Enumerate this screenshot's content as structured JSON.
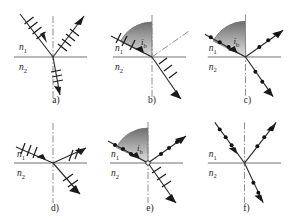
{
  "figure": {
    "medium_labels": {
      "upper": "n",
      "upper_sub": "1",
      "lower": "n",
      "lower_sub": "2"
    },
    "angle_label": {
      "symbol": "i",
      "subscript": "b"
    },
    "colors": {
      "ray": "#2b2b2b",
      "axis": "#707070",
      "dash": "#8c8c8c",
      "mark": "#111111",
      "wedge_top": "#6e6e6e",
      "wedge_bottom": "#d8d8d8",
      "background": "#ffffff"
    },
    "panels": [
      {
        "id": "a",
        "caption": "a)",
        "marks": {
          "incident": "ticks",
          "reflected": "ticks",
          "refracted": "ticks"
        },
        "angle_arc": false,
        "angle_label_visible": false,
        "rays": {
          "incident_angle_deg": 38,
          "reflected_angle_deg": 38,
          "refracted_angle_deg": 10
        }
      },
      {
        "id": "b",
        "caption": "b)",
        "marks": {
          "incident": "ticks",
          "reflected": "none",
          "refracted": "ticks"
        },
        "angle_arc": true,
        "angle_label_visible": true,
        "rays": {
          "incident_angle_deg": 62,
          "reflected_angle_deg": 62,
          "refracted_angle_deg": 28
        }
      },
      {
        "id": "c",
        "caption": "c)",
        "marks": {
          "incident": "dots",
          "reflected": "dots",
          "refracted": "dots"
        },
        "angle_arc": true,
        "angle_label_visible": true,
        "rays": {
          "incident_angle_deg": 62,
          "reflected_angle_deg": 62,
          "refracted_angle_deg": 28
        }
      },
      {
        "id": "d",
        "caption": "d)",
        "marks": {
          "incident": "ticks",
          "reflected": "ticks",
          "refracted": "ticks"
        },
        "angle_arc": false,
        "angle_label_visible": false,
        "rays": {
          "incident_angle_deg": 72,
          "reflected_angle_deg": 72,
          "refracted_angle_deg": 48
        }
      },
      {
        "id": "e",
        "caption": "e)",
        "marks": {
          "incident": "dots",
          "reflected": "dots",
          "refracted": "ticks"
        },
        "angle_arc": true,
        "angle_label_visible": true,
        "rays": {
          "incident_angle_deg": 62,
          "reflected_angle_deg": 62,
          "refracted_angle_deg": 28
        }
      },
      {
        "id": "f",
        "caption": "f)",
        "marks": {
          "incident": "dots",
          "reflected": "dots",
          "refracted": "dots"
        },
        "angle_arc": false,
        "angle_label_visible": false,
        "rays": {
          "incident_angle_deg": 35,
          "reflected_angle_deg": 35,
          "refracted_angle_deg": 20
        }
      }
    ]
  }
}
